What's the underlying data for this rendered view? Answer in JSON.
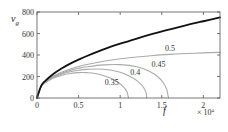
{
  "chart_data": {
    "type": "line",
    "title": "",
    "xlabel": "f",
    "ylabel": "v_g",
    "x_multiplier_label": "× 10^4",
    "xlim": [
      0,
      2.2
    ],
    "ylim": [
      0,
      800
    ],
    "xticks": [
      0,
      0.5,
      1,
      1.5,
      2
    ],
    "xtick_labels": [
      "0",
      "0.5",
      "1",
      "1.5",
      "2"
    ],
    "yticks": [
      0,
      200,
      400,
      600,
      800
    ],
    "ytick_labels": [
      "0",
      "200",
      "400",
      "600",
      "800"
    ],
    "grid": false,
    "series": [
      {
        "name": "limit",
        "style": "bold-black",
        "color": "#111111",
        "x": [
          0,
          0.05,
          0.1,
          0.2,
          0.3,
          0.4,
          0.5,
          0.6,
          0.8,
          1.0,
          1.2,
          1.4,
          1.6,
          1.8,
          2.0,
          2.2
        ],
        "y": [
          0,
          113,
          160,
          226,
          277,
          320,
          357,
          391,
          452,
          505,
          553,
          598,
          639,
          678,
          714,
          749
        ]
      },
      {
        "name": "0.5",
        "label": "0.5",
        "color": "#aaaaaa",
        "x": [
          0,
          0.05,
          0.1,
          0.2,
          0.3,
          0.4,
          0.5,
          0.6,
          0.8,
          1.0,
          1.2,
          1.4,
          1.6,
          1.8,
          2.0,
          2.2
        ],
        "y": [
          0,
          110,
          152,
          205,
          242,
          270,
          293,
          312,
          342,
          365,
          382,
          396,
          406,
          414,
          420,
          424
        ]
      },
      {
        "name": "0.45",
        "label": "0.45",
        "color": "#aaaaaa",
        "x": [
          0,
          0.05,
          0.1,
          0.2,
          0.3,
          0.4,
          0.5,
          0.6,
          0.8,
          1.0,
          1.2,
          1.35,
          1.45,
          1.52,
          1.56,
          1.58
        ],
        "y": [
          0,
          108,
          148,
          198,
          232,
          257,
          276,
          290,
          308,
          310,
          290,
          250,
          200,
          140,
          80,
          0
        ]
      },
      {
        "name": "0.4",
        "label": "0.4",
        "color": "#aaaaaa",
        "x": [
          0,
          0.05,
          0.1,
          0.2,
          0.3,
          0.4,
          0.5,
          0.6,
          0.8,
          1.0,
          1.12,
          1.22,
          1.28,
          1.31,
          1.32
        ],
        "y": [
          0,
          106,
          145,
          192,
          223,
          244,
          258,
          266,
          268,
          240,
          200,
          150,
          100,
          50,
          0
        ]
      },
      {
        "name": "0.35",
        "label": "0.35",
        "color": "#aaaaaa",
        "x": [
          0,
          0.05,
          0.1,
          0.2,
          0.3,
          0.4,
          0.5,
          0.6,
          0.7,
          0.85,
          0.95,
          1.03,
          1.08,
          1.1
        ],
        "y": [
          0,
          104,
          141,
          185,
          212,
          228,
          236,
          236,
          228,
          196,
          158,
          110,
          60,
          0
        ]
      }
    ],
    "annotations": [
      {
        "text": "0.5",
        "series": "0.5",
        "x": 1.6,
        "y": 440
      },
      {
        "text": "0.45",
        "series": "0.45",
        "x": 1.46,
        "y": 290
      },
      {
        "text": "0.4",
        "series": "0.4",
        "x": 1.18,
        "y": 215
      },
      {
        "text": "0.35",
        "series": "0.35",
        "x": 0.9,
        "y": 120
      }
    ]
  }
}
